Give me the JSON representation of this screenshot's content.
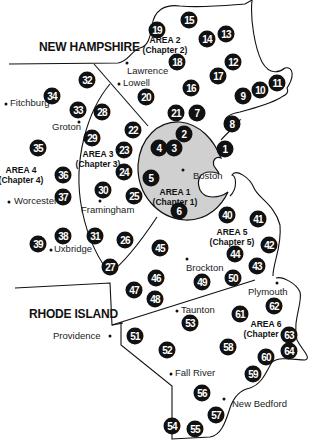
{
  "states": {
    "new_hampshire": "NEW HAMPSHIRE",
    "rhode_island": "RHODE ISLAND"
  },
  "areas": [
    {
      "name": "AREA 1",
      "chapter": "(Chapter 1)",
      "x": 176,
      "y": 214
    },
    {
      "name": "AREA 2",
      "chapter": "(Chapter 2)",
      "x": 165,
      "y": 38
    },
    {
      "name": "AREA 3",
      "chapter": "(Chapter 3)",
      "x": 98,
      "y": 152
    },
    {
      "name": "AREA 4",
      "chapter": "(Chapter 4)",
      "x": 21,
      "y": 168
    },
    {
      "name": "AREA 5",
      "chapter": "(Chapter 5)",
      "x": 232,
      "y": 230
    },
    {
      "name": "AREA 6",
      "chapter": "(Chapter 6)",
      "x": 268,
      "y": 322
    }
  ],
  "towns": [
    {
      "name": "Lawrence",
      "x": 127,
      "y": 64,
      "dx": 0,
      "dy": 5,
      "side": "below"
    },
    {
      "name": "Lowell",
      "x": 118,
      "y": 84,
      "dx": 4,
      "dy": -6,
      "side": "right"
    },
    {
      "name": "Fitchburg",
      "x": 6,
      "y": 104,
      "dx": 4,
      "dy": -6,
      "side": "right"
    },
    {
      "name": "Groton",
      "x": 79,
      "y": 122,
      "dx": -32,
      "dy": -4,
      "side": "left"
    },
    {
      "name": "Boston",
      "x": 183,
      "y": 170,
      "dx": 10,
      "dy": 2,
      "side": "right"
    },
    {
      "name": "Worcester",
      "x": 9,
      "y": 201,
      "dx": 4,
      "dy": -6,
      "side": "right"
    },
    {
      "name": "Framingham",
      "x": 100,
      "y": 201,
      "dx": -20,
      "dy": 4,
      "side": "below"
    },
    {
      "name": "Uxbridge",
      "x": 51,
      "y": 249,
      "dx": 3,
      "dy": -6,
      "side": "right"
    },
    {
      "name": "Brockton",
      "x": 187,
      "y": 260,
      "dx": -1,
      "dy": 3,
      "side": "below"
    },
    {
      "name": "Plymouth",
      "x": 277,
      "y": 283,
      "dx": -20,
      "dy": 4,
      "side": "below"
    },
    {
      "name": "Taunton",
      "x": 177,
      "y": 310,
      "dx": 3,
      "dy": -6,
      "side": "right"
    },
    {
      "name": "Providence",
      "x": 110,
      "y": 336,
      "dx": -60,
      "dy": -6,
      "side": "left"
    },
    {
      "name": "Fall River",
      "x": 170,
      "y": 373,
      "dx": 4,
      "dy": -6,
      "side": "right"
    },
    {
      "name": "New Bedford",
      "x": 223,
      "y": 399,
      "dx": 8,
      "dy": -1,
      "side": "right"
    }
  ],
  "markers": [
    {
      "n": "1",
      "x": 225,
      "y": 149
    },
    {
      "n": "2",
      "x": 184,
      "y": 134
    },
    {
      "n": "3",
      "x": 174,
      "y": 148
    },
    {
      "n": "4",
      "x": 159,
      "y": 148
    },
    {
      "n": "5",
      "x": 151,
      "y": 178
    },
    {
      "n": "6",
      "x": 179,
      "y": 211
    },
    {
      "n": "7",
      "x": 197,
      "y": 113
    },
    {
      "n": "8",
      "x": 232,
      "y": 124
    },
    {
      "n": "9",
      "x": 243,
      "y": 96
    },
    {
      "n": "10",
      "x": 260,
      "y": 90
    },
    {
      "n": "11",
      "x": 277,
      "y": 83
    },
    {
      "n": "12",
      "x": 233,
      "y": 62
    },
    {
      "n": "13",
      "x": 226,
      "y": 34
    },
    {
      "n": "14",
      "x": 207,
      "y": 39
    },
    {
      "n": "15",
      "x": 189,
      "y": 20
    },
    {
      "n": "16",
      "x": 191,
      "y": 88
    },
    {
      "n": "17",
      "x": 218,
      "y": 76
    },
    {
      "n": "18",
      "x": 177,
      "y": 62
    },
    {
      "n": "19",
      "x": 157,
      "y": 30
    },
    {
      "n": "20",
      "x": 146,
      "y": 97
    },
    {
      "n": "21",
      "x": 176,
      "y": 113
    },
    {
      "n": "22",
      "x": 133,
      "y": 130
    },
    {
      "n": "23",
      "x": 124,
      "y": 150
    },
    {
      "n": "24",
      "x": 124,
      "y": 172
    },
    {
      "n": "25",
      "x": 134,
      "y": 196
    },
    {
      "n": "26",
      "x": 125,
      "y": 240
    },
    {
      "n": "27",
      "x": 110,
      "y": 267
    },
    {
      "n": "28",
      "x": 102,
      "y": 112
    },
    {
      "n": "29",
      "x": 92,
      "y": 138
    },
    {
      "n": "30",
      "x": 103,
      "y": 190
    },
    {
      "n": "31",
      "x": 95,
      "y": 236
    },
    {
      "n": "32",
      "x": 87,
      "y": 80
    },
    {
      "n": "33",
      "x": 78,
      "y": 110
    },
    {
      "n": "34",
      "x": 52,
      "y": 96
    },
    {
      "n": "35",
      "x": 38,
      "y": 148
    },
    {
      "n": "36",
      "x": 63,
      "y": 175
    },
    {
      "n": "37",
      "x": 63,
      "y": 197
    },
    {
      "n": "38",
      "x": 63,
      "y": 236
    },
    {
      "n": "39",
      "x": 38,
      "y": 244
    },
    {
      "n": "40",
      "x": 227,
      "y": 215
    },
    {
      "n": "41",
      "x": 258,
      "y": 219
    },
    {
      "n": "42",
      "x": 269,
      "y": 245
    },
    {
      "n": "43",
      "x": 257,
      "y": 266
    },
    {
      "n": "44",
      "x": 235,
      "y": 254
    },
    {
      "n": "45",
      "x": 160,
      "y": 248
    },
    {
      "n": "46",
      "x": 156,
      "y": 278
    },
    {
      "n": "47",
      "x": 134,
      "y": 290
    },
    {
      "n": "48",
      "x": 155,
      "y": 299
    },
    {
      "n": "49",
      "x": 202,
      "y": 282
    },
    {
      "n": "50",
      "x": 233,
      "y": 278
    },
    {
      "n": "51",
      "x": 135,
      "y": 336
    },
    {
      "n": "52",
      "x": 167,
      "y": 350
    },
    {
      "n": "53",
      "x": 190,
      "y": 323
    },
    {
      "n": "54",
      "x": 172,
      "y": 426
    },
    {
      "n": "55",
      "x": 195,
      "y": 429
    },
    {
      "n": "56",
      "x": 202,
      "y": 393
    },
    {
      "n": "57",
      "x": 216,
      "y": 415
    },
    {
      "n": "58",
      "x": 228,
      "y": 347
    },
    {
      "n": "59",
      "x": 253,
      "y": 374
    },
    {
      "n": "60",
      "x": 266,
      "y": 357
    },
    {
      "n": "61",
      "x": 240,
      "y": 314
    },
    {
      "n": "62",
      "x": 274,
      "y": 306
    },
    {
      "n": "63",
      "x": 289,
      "y": 335
    },
    {
      "n": "64",
      "x": 289,
      "y": 351
    }
  ],
  "colors": {
    "marker_fill": "#111111",
    "marker_text": "#ffffff",
    "area1_fill": "#d0d0d0",
    "line": "#111111"
  }
}
